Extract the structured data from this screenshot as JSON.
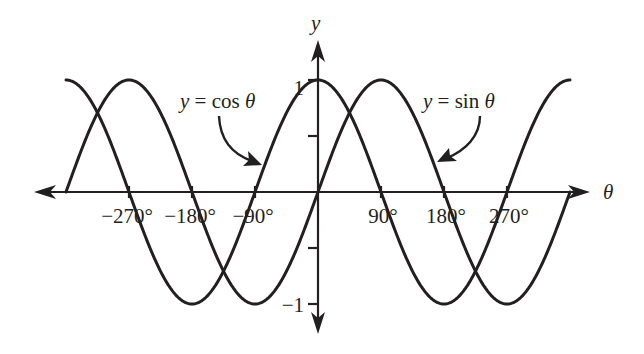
{
  "chart_data": {
    "type": "line",
    "title": "",
    "xlabel": "θ",
    "ylabel": "y",
    "xunit": "degrees",
    "xlim": [
      -360,
      360
    ],
    "ylim": [
      -1,
      1
    ],
    "grid": false,
    "x_ticks": [
      -270,
      -180,
      -90,
      90,
      180,
      270
    ],
    "x_tick_labels": [
      "−270°",
      "−180°",
      "−90°",
      "90°",
      "180°",
      "270°"
    ],
    "y_ticks": [
      1,
      0.5,
      -0.5,
      -1
    ],
    "y_tick_labels": [
      "1",
      "",
      "",
      "−1"
    ],
    "series": [
      {
        "name": "y = cos θ",
        "function": "cos",
        "domain": [
          -360,
          360
        ],
        "x": [
          -360,
          -270,
          -180,
          -90,
          0,
          90,
          180,
          270,
          360
        ],
        "values": [
          1,
          0,
          -1,
          0,
          1,
          0,
          -1,
          0,
          1
        ]
      },
      {
        "name": "y = sin θ",
        "function": "sin",
        "domain": [
          -360,
          360
        ],
        "x": [
          -360,
          -270,
          -180,
          -90,
          0,
          90,
          180,
          270,
          360
        ],
        "values": [
          0,
          1,
          0,
          -1,
          0,
          1,
          0,
          -1,
          0
        ]
      }
    ],
    "annotations": [
      {
        "text_parts": [
          "y",
          " = ",
          "cos",
          " θ"
        ],
        "points_to_series": "y = cos θ",
        "target_x": -90
      },
      {
        "text_parts": [
          "y",
          " = ",
          "sin",
          " θ"
        ],
        "points_to_series": "y = sin θ",
        "target_x": 180
      }
    ]
  }
}
